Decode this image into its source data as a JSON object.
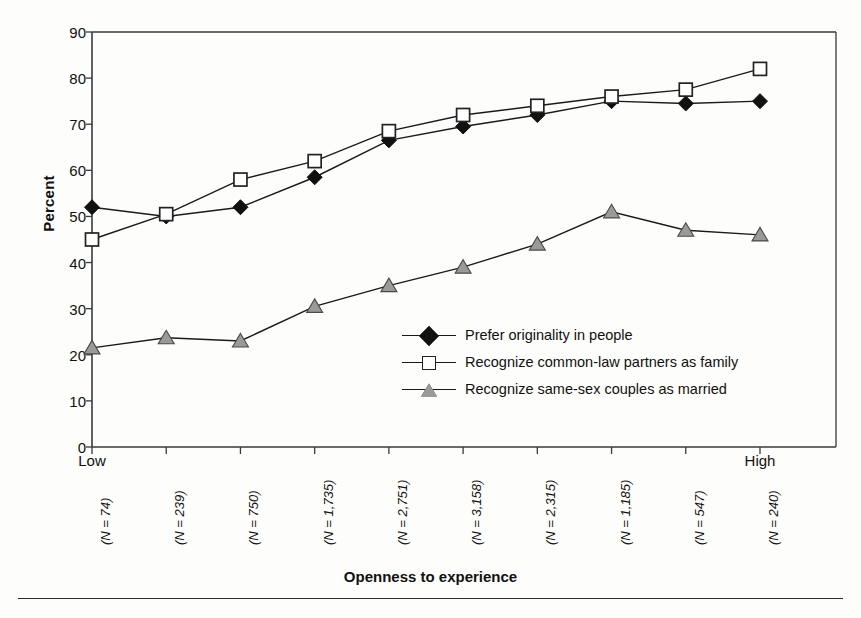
{
  "chart_data": {
    "type": "line",
    "title": "",
    "xlabel": "Openness to experience",
    "ylabel": "Percent",
    "ylim": [
      0,
      90
    ],
    "yticks": [
      0,
      10,
      20,
      30,
      40,
      50,
      60,
      70,
      80,
      90
    ],
    "grid": false,
    "legend_position": "inside-center-right",
    "x_low_label": "Low",
    "x_high_label": "High",
    "categories": [
      "(N = 74)",
      "(N = 239)",
      "(N = 750)",
      "(N = 1,735)",
      "(N = 2,751)",
      "(N = 3,158)",
      "(N = 2,315)",
      "(N = 1,185)",
      "(N = 547)",
      "(N = 240)"
    ],
    "series": [
      {
        "name": "Prefer originality in people",
        "marker": "filled-diamond",
        "color": "#111111",
        "values": [
          52,
          50,
          52,
          58.5,
          66.5,
          69.5,
          72,
          75,
          74.5,
          75
        ]
      },
      {
        "name": "Recognize common-law partners as family",
        "marker": "open-square",
        "color": "#222222",
        "values": [
          45,
          50.5,
          58,
          62,
          68.5,
          72,
          74,
          76,
          77.5,
          82
        ]
      },
      {
        "name": "Recognize same-sex couples as married",
        "marker": "grey-triangle",
        "color": "#9a9a9a",
        "values": [
          21.5,
          23.7,
          23,
          30.5,
          35,
          39,
          44,
          51,
          47,
          46
        ]
      }
    ]
  },
  "legend": {
    "items": [
      "Prefer originality in people",
      "Recognize common-law partners as family",
      "Recognize same-sex couples as married"
    ]
  }
}
